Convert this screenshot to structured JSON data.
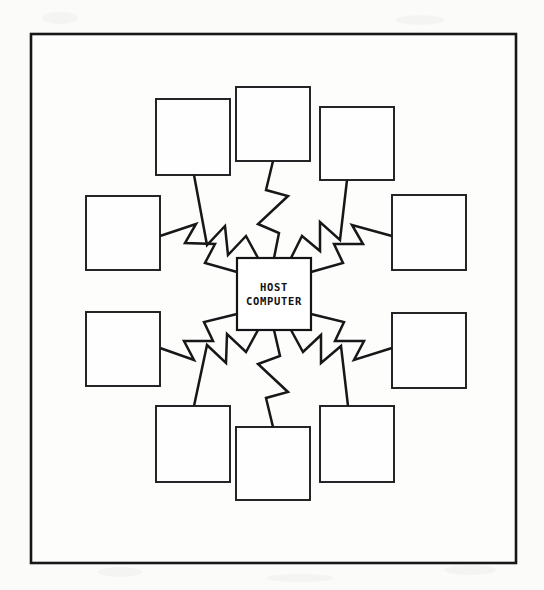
{
  "document": {
    "title": "Host Computer Star Network Diagram",
    "page_background": "#fbfbfa",
    "ink_color": "#17171a"
  },
  "frame": {
    "name": "figure-border",
    "x": 31,
    "y": 34,
    "width": 485,
    "height": 529,
    "stroke": "#17171a",
    "stroke_width": 2.6
  },
  "host": {
    "label_line_1": "HOST",
    "label_line_2": "COMPUTER",
    "x": 237,
    "y": 258,
    "width": 74,
    "height": 72,
    "center_x": 274,
    "center_y": 294
  },
  "terminals": [
    {
      "id": "terminal-top-left",
      "label": "",
      "x": 156,
      "y": 99,
      "width": 74,
      "height": 76
    },
    {
      "id": "terminal-top-center",
      "label": "",
      "x": 236,
      "y": 87,
      "width": 74,
      "height": 74
    },
    {
      "id": "terminal-top-right",
      "label": "",
      "x": 320,
      "y": 107,
      "width": 74,
      "height": 73
    },
    {
      "id": "terminal-left-upper",
      "label": "",
      "x": 86,
      "y": 196,
      "width": 74,
      "height": 74
    },
    {
      "id": "terminal-right-upper",
      "label": "",
      "x": 392,
      "y": 195,
      "width": 74,
      "height": 75
    },
    {
      "id": "terminal-left-lower",
      "label": "",
      "x": 86,
      "y": 312,
      "width": 74,
      "height": 74
    },
    {
      "id": "terminal-right-lower",
      "label": "",
      "x": 392,
      "y": 313,
      "width": 74,
      "height": 75
    },
    {
      "id": "terminal-bottom-left",
      "label": "",
      "x": 156,
      "y": 406,
      "width": 74,
      "height": 76
    },
    {
      "id": "terminal-bottom-center",
      "label": "",
      "x": 236,
      "y": 427,
      "width": 74,
      "height": 73
    },
    {
      "id": "terminal-bottom-right",
      "label": "",
      "x": 320,
      "y": 406,
      "width": 74,
      "height": 76
    }
  ],
  "links": [
    {
      "id": "link-top-left",
      "from": "host",
      "to": "terminal-top-left",
      "path": "M 258 258 L 246 236 L 228 255 L 225 226 L 207 245 L 194 175"
    },
    {
      "id": "link-top-center",
      "from": "host",
      "to": "terminal-top-center",
      "path": "M 274 258 L 279 233 L 258 224 L 288 196 L 266 190 L 273 161"
    },
    {
      "id": "link-top-right",
      "from": "host",
      "to": "terminal-top-right",
      "path": "M 291 258 L 302 236 L 320 251 L 320 222 L 340 240 L 347 180"
    },
    {
      "id": "link-left-upper",
      "from": "host",
      "to": "terminal-left-upper",
      "path": "M 237 272 L 205 263 L 215 244 L 185 243 L 196 224 L 160 236"
    },
    {
      "id": "link-right-upper",
      "from": "host",
      "to": "terminal-right-upper",
      "path": "M 311 272 L 343 263 L 334 244 L 363 244 L 352 225 L 392 236"
    },
    {
      "id": "link-left-lower",
      "from": "host",
      "to": "terminal-left-lower",
      "path": "M 237 314 L 204 322 L 213 341 L 184 341 L 194 360 L 160 348"
    },
    {
      "id": "link-right-lower",
      "from": "host",
      "to": "terminal-right-lower",
      "path": "M 311 314 L 344 322 L 335 341 L 364 341 L 354 360 L 392 348"
    },
    {
      "id": "link-bottom-left",
      "from": "host",
      "to": "terminal-bottom-left",
      "path": "M 258 330 L 246 352 L 227 334 L 226 363 L 207 345 L 194 406"
    },
    {
      "id": "link-bottom-center",
      "from": "host",
      "to": "terminal-bottom-center",
      "path": "M 274 330 L 280 356 L 258 364 L 288 392 L 266 398 L 273 427"
    },
    {
      "id": "link-bottom-right",
      "from": "host",
      "to": "terminal-bottom-right",
      "path": "M 291 330 L 303 352 L 321 335 L 321 363 L 341 346 L 348 406"
    }
  ],
  "chart_data": {
    "type": "diagram",
    "diagram_kind": "star-topology-network",
    "center_node": "HOST COMPUTER",
    "peripheral_node_count": 10,
    "peripheral_node_labels": [
      "",
      "",
      "",
      "",
      "",
      "",
      "",
      "",
      "",
      ""
    ],
    "connection_count": 10,
    "connection_style": "lightning-bolt-zigzag"
  }
}
